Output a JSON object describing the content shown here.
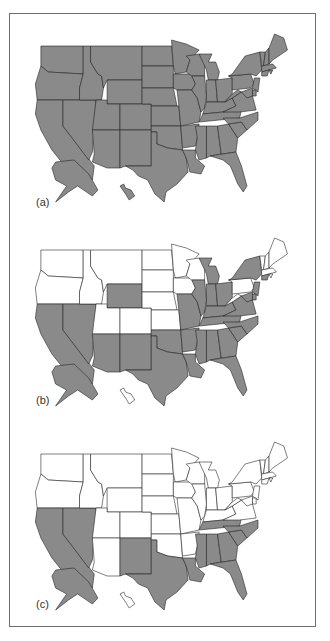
{
  "figure": {
    "panels": [
      {
        "label": "(a)",
        "shaded": [
          "WA",
          "OR",
          "CA",
          "NV",
          "ID",
          "MT",
          "WY",
          "UT",
          "CO",
          "AZ",
          "NM",
          "ND",
          "SD",
          "NE",
          "KS",
          "OK",
          "TX",
          "MN",
          "IA",
          "MO",
          "AR",
          "LA",
          "WI",
          "IL",
          "MI",
          "IN",
          "OH",
          "KY",
          "TN",
          "MS",
          "AL",
          "GA",
          "FL",
          "SC",
          "NC",
          "VA",
          "WV",
          "PA",
          "NY",
          "VT",
          "NH",
          "ME",
          "MA",
          "RI",
          "CT",
          "NJ",
          "DE",
          "MD",
          "AK",
          "HI"
        ]
      },
      {
        "label": "(b)",
        "shaded": [
          "CA",
          "NV",
          "WY",
          "AZ",
          "NM",
          "TX",
          "OK",
          "MO",
          "AR",
          "LA",
          "IL",
          "MI",
          "IN",
          "OH",
          "KY",
          "TN",
          "MS",
          "AL",
          "GA",
          "FL",
          "SC",
          "NC",
          "VA",
          "NY",
          "CT",
          "NJ",
          "DE",
          "MD",
          "AK"
        ]
      },
      {
        "label": "(c)",
        "shaded": [
          "CA",
          "NV",
          "NM",
          "TX",
          "LA",
          "MS",
          "AL",
          "GA",
          "FL",
          "SC",
          "NC",
          "TN",
          "AK"
        ]
      }
    ],
    "colors": {
      "shaded": "#8a8a8a",
      "unshaded": "#ffffff",
      "border": "#222222",
      "frame": "#6f6f6f"
    }
  }
}
